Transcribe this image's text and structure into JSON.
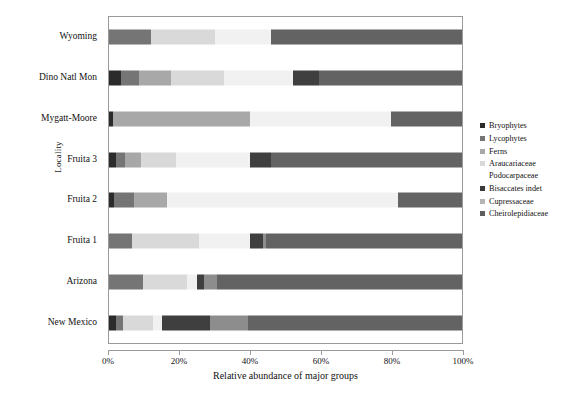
{
  "chart_data": {
    "type": "bar",
    "orientation": "horizontal",
    "stacked": true,
    "normalized": "100%",
    "title": "",
    "xlabel": "Relative abundance of major groups",
    "ylabel": "Locality",
    "xlim": [
      0,
      100
    ],
    "xticks": [
      0,
      20,
      40,
      60,
      80,
      100
    ],
    "xticklabels": [
      "0%",
      "20%",
      "40%",
      "60%",
      "80%",
      "100%"
    ],
    "grid": false,
    "legend_position": "right",
    "categories": [
      "New Mexico",
      "Arizona",
      "Fruita 1",
      "Fruita 2",
      "Fruita 3",
      "Mygatt-Moore",
      "Dino Natl Mon",
      "Wyoming"
    ],
    "series": [
      {
        "name": "Bryophytes",
        "color": "#2b2b2b",
        "values": [
          2.0,
          0.0,
          0.0,
          1.5,
          2.0,
          1.0,
          3.5,
          0.0
        ]
      },
      {
        "name": "Lycophytes",
        "color": "#757575",
        "values": [
          2.0,
          9.5,
          6.5,
          5.5,
          2.5,
          0.0,
          5.0,
          12.0
        ]
      },
      {
        "name": "Ferns",
        "color": "#a8a8a8",
        "values": [
          0.0,
          0.0,
          0.0,
          9.5,
          4.5,
          39.0,
          9.0,
          0.0
        ]
      },
      {
        "name": "Araucariaceae Podocarpaceae",
        "color": "#d9d9d9",
        "values": [
          8.5,
          12.5,
          19.0,
          0.0,
          10.0,
          0.0,
          15.0,
          18.0
        ]
      },
      {
        "name": "Bisaccates indet",
        "color": "#f1f1f1",
        "values": [
          2.5,
          3.0,
          14.5,
          65.5,
          21.0,
          40.0,
          19.5,
          16.0
        ]
      },
      {
        "name": "Cupressaceae",
        "color": "#3f3f3f",
        "values": [
          13.5,
          2.0,
          3.5,
          0.0,
          6.0,
          0.0,
          7.5,
          0.0
        ]
      },
      {
        "name": "Cheirolepidiaceae",
        "color": "#8d8d8d",
        "values": [
          11.0,
          3.5,
          1.0,
          0.0,
          0.0,
          0.0,
          0.0,
          0.0
        ]
      }
    ],
    "extra_tail": {
      "note": "trailing dark fill completing each bar to 100%",
      "color": "#636363",
      "values": [
        60.5,
        69.5,
        55.5,
        18.0,
        54.0,
        20.0,
        40.5,
        54.0
      ]
    }
  },
  "axis": {
    "y_title": "Locality",
    "x_title": "Relative abundance of major groups"
  },
  "legend": {
    "items": [
      {
        "label": "Bryophytes",
        "label2": "",
        "swatch": "#2b2b2b"
      },
      {
        "label": "Lycophytes",
        "label2": "",
        "swatch": "#757575"
      },
      {
        "label": "Ferns",
        "label2": "",
        "swatch": "#a8a8a8"
      },
      {
        "label": "Araucariaceae",
        "label2": "Podocarpaceae",
        "swatch": "#d9d9d9"
      },
      {
        "label": "Bisaccates indet",
        "label2": "",
        "swatch": "#3a3a3a"
      },
      {
        "label": "Cupressaceae",
        "label2": "",
        "swatch": "#b5b5b5"
      },
      {
        "label": "Cheirolepidiaceae",
        "label2": "",
        "swatch": "#5e5e5e"
      }
    ]
  }
}
